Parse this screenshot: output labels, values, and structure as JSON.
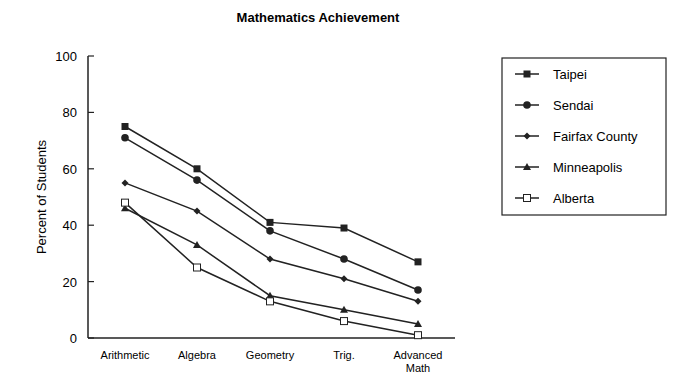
{
  "chart_data": {
    "type": "line",
    "title": "Mathematics Achievement",
    "xlabel": "",
    "ylabel": "Percent of Students",
    "ylim": [
      0,
      100
    ],
    "yticks": [
      0,
      20,
      40,
      60,
      80,
      100
    ],
    "categories": [
      "Arithmetic",
      "Algebra",
      "Geometry",
      "Trig.",
      "Advanced Math"
    ],
    "category_lines": [
      [
        "Arithmetic"
      ],
      [
        "Algebra"
      ],
      [
        "Geometry"
      ],
      [
        "Trig."
      ],
      [
        "Advanced",
        "Math"
      ]
    ],
    "grid": false,
    "legend_position": "right",
    "series": [
      {
        "name": "Taipei",
        "marker": "square-filled",
        "values": [
          75,
          60,
          41,
          39,
          27
        ]
      },
      {
        "name": "Sendai",
        "marker": "circle-filled",
        "values": [
          71,
          56,
          38,
          28,
          17
        ]
      },
      {
        "name": "Fairfax County",
        "marker": "diamond-filled",
        "values": [
          55,
          45,
          28,
          21,
          13
        ]
      },
      {
        "name": "Minneapolis",
        "marker": "triangle-filled",
        "values": [
          46,
          33,
          15,
          10,
          5
        ]
      },
      {
        "name": "Alberta",
        "marker": "square-open",
        "values": [
          48,
          25,
          13,
          6,
          1
        ]
      }
    ]
  },
  "colors": {
    "line": "#222222",
    "axis": "#222222",
    "background": "#ffffff"
  }
}
